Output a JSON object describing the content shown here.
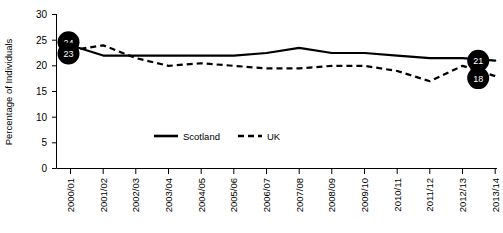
{
  "chart_data": {
    "type": "line",
    "title": "",
    "xlabel": "",
    "ylabel": "Percentage of Individuals",
    "ylim": [
      0,
      30
    ],
    "yticks": [
      0,
      5,
      10,
      15,
      20,
      25,
      30
    ],
    "grid": false,
    "legend_position": "bottom-center",
    "categories": [
      "2000/01",
      "2001/02",
      "2002/03",
      "2003/04",
      "2004/05",
      "2005/06",
      "2006/07",
      "2007/08",
      "2008/09",
      "2009/10",
      "2010/11",
      "2011/12",
      "2012/13",
      "2013/14"
    ],
    "series": [
      {
        "name": "Scotland",
        "style": "solid",
        "color": "#000000",
        "values": [
          24,
          22,
          22,
          22,
          22,
          22,
          22.5,
          23.5,
          22.5,
          22.5,
          22,
          21.5,
          21.5,
          21
        ]
      },
      {
        "name": "UK",
        "style": "dashed",
        "color": "#000000",
        "values": [
          23,
          24,
          21.5,
          20,
          20.5,
          20,
          19.5,
          19.5,
          20,
          20,
          19,
          17,
          20,
          18
        ]
      }
    ],
    "annotations": [
      {
        "label": "24",
        "series": "Scotland",
        "category": "2000/01",
        "value": 24,
        "position": "left"
      },
      {
        "label": "23",
        "series": "UK",
        "category": "2000/01",
        "value": 23,
        "position": "left"
      },
      {
        "label": "21",
        "series": "Scotland",
        "category": "2013/14",
        "value": 21,
        "position": "right"
      },
      {
        "label": "18",
        "series": "UK",
        "category": "2013/14",
        "value": 18,
        "position": "right"
      }
    ]
  },
  "legend": {
    "items": [
      {
        "label": "Scotland",
        "style": "solid"
      },
      {
        "label": "UK",
        "style": "dashed"
      }
    ]
  },
  "axes": {
    "y_title": "Percentage of Individuals",
    "y_ticks": [
      "30",
      "25",
      "20",
      "15",
      "10",
      "5",
      "0"
    ],
    "x_ticks": [
      "2000/01",
      "2001/02",
      "2002/03",
      "2003/04",
      "2004/05",
      "2005/06",
      "2006/07",
      "2007/08",
      "2008/09",
      "2009/10",
      "2010/11",
      "2011/12",
      "2012/13",
      "2013/14"
    ]
  },
  "colors": {
    "foreground": "#000000",
    "background": "#ffffff",
    "badge_fill": "#000000",
    "badge_text": "#ffffff"
  }
}
